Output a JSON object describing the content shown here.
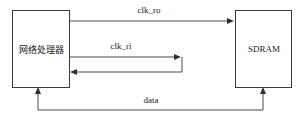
{
  "diagram": {
    "title": "",
    "type": "block-diagram",
    "canvas": {
      "width": 300,
      "height": 119,
      "background": "#ffffff"
    },
    "colors": {
      "box_stroke": "#3a3a3a",
      "box_fill": "#ffffff",
      "line": "#4a4a4a",
      "arrow": "#2e2e2e",
      "text": "#1a1a1a"
    },
    "nodes": [
      {
        "id": "network-processor",
        "label": "网络处理器",
        "x": 12,
        "y": 10,
        "width": 58,
        "height": 78
      },
      {
        "id": "sdram",
        "label": "SDRAM",
        "x": 235,
        "y": 10,
        "width": 57,
        "height": 78
      }
    ],
    "edges": [
      {
        "id": "clk-ro",
        "label": "clk_ro",
        "from": "network-processor",
        "to": "sdram",
        "direction": "forward",
        "label_x": 149,
        "label_y": 11
      },
      {
        "id": "clk-ri",
        "label": "clk_ri",
        "from": "network-processor",
        "to": "network-processor",
        "direction": "loopback",
        "label_x": 121,
        "label_y": 47
      },
      {
        "id": "data",
        "label": "data",
        "from": "network-processor",
        "to": "sdram",
        "direction": "bidirectional",
        "label_x": 151,
        "label_y": 101
      }
    ]
  }
}
